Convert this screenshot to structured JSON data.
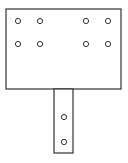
{
  "diagram": {
    "type": "mounting-plate-with-stem",
    "stroke_color": "#333333",
    "background": "#ffffff",
    "plate": {
      "x": 6,
      "y": 9,
      "width": 115,
      "height": 80
    },
    "stem": {
      "x": 54,
      "y": 89,
      "width": 19,
      "height": 64
    },
    "plate_holes": [
      {
        "cx": 18,
        "cy": 21
      },
      {
        "cx": 40,
        "cy": 21
      },
      {
        "cx": 86,
        "cy": 21
      },
      {
        "cx": 108,
        "cy": 21
      },
      {
        "cx": 18,
        "cy": 44
      },
      {
        "cx": 40,
        "cy": 44
      },
      {
        "cx": 86,
        "cy": 44
      },
      {
        "cx": 108,
        "cy": 44
      }
    ],
    "stem_holes": [
      {
        "cx": 64,
        "cy": 117
      },
      {
        "cx": 64,
        "cy": 142
      }
    ],
    "hole_radius": 2.6
  }
}
